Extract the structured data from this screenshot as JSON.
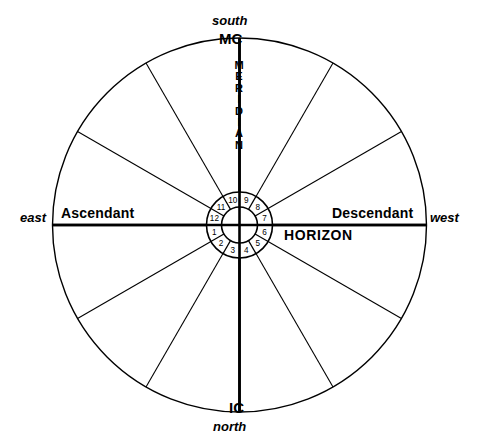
{
  "diagram": {
    "type": "natural-house-wheel",
    "stroke_color": "#000000",
    "background_color": "#ffffff",
    "geometry": {
      "center_x": 239.5,
      "center_y": 225,
      "outer_radius": 187,
      "ring_outer_radius": 33,
      "ring_inner_radius": 18,
      "spoke_count": 12,
      "spoke_step_degrees": 30
    },
    "cardinal_labels": {
      "south": "south",
      "north": "north",
      "east": "east",
      "west": "west"
    },
    "angle_labels": {
      "mc": "MC",
      "ic": "IC",
      "ascendant": "Ascendant",
      "descendant": "Descendant"
    },
    "axis_labels": {
      "meridian": "MERIDIAN",
      "horizon": "HORIZON"
    },
    "houses": [
      {
        "number": "1",
        "angle_deg": 195
      },
      {
        "number": "2",
        "angle_deg": 225
      },
      {
        "number": "3",
        "angle_deg": 255
      },
      {
        "number": "4",
        "angle_deg": 285
      },
      {
        "number": "5",
        "angle_deg": 315
      },
      {
        "number": "6",
        "angle_deg": 345
      },
      {
        "number": "7",
        "angle_deg": 15
      },
      {
        "number": "8",
        "angle_deg": 45
      },
      {
        "number": "9",
        "angle_deg": 75
      },
      {
        "number": "10",
        "angle_deg": 105
      },
      {
        "number": "11",
        "angle_deg": 135
      },
      {
        "number": "12",
        "angle_deg": 165
      }
    ]
  }
}
